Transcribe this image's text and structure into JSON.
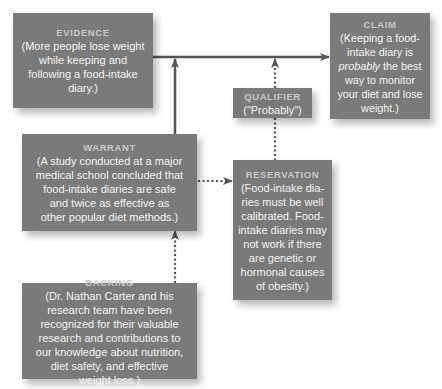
{
  "diagram": {
    "type": "Toulmin argument model",
    "nodes": {
      "evidence": {
        "title": "EVIDENCE",
        "body": "(More people lose weight\nwhile keeping and\nfollowing a food-intake\ndiary.)"
      },
      "claim": {
        "title": "CLAIM",
        "body_pre": "(Keeping a food-\nintake diary is\n",
        "body_emphasis": "probably",
        "body_post": " the best\nway to monitor\nyour diet and lose\nweight.)"
      },
      "qualifier": {
        "title": "QUALIFIER",
        "body": "(\"Probably\")"
      },
      "warrant": {
        "title": "WARRANT",
        "body": "(A study conducted at a major\nmedical school concluded that\nfood-intake diaries are safe\nand twice as effective as\nother popular diet methods.)"
      },
      "reservation": {
        "title": "RESERVATION",
        "body": "(Food-intake dia-\nries must be well\ncalibrated. Food-\nintake diaries may\nnot work if there\nare genetic or\nhormonal causes\nof obesity.)"
      },
      "backing": {
        "title": "BACKING",
        "body": "(Dr. Nathan Carter and his\nresearch team have been\nrecognized for their valuable\nresearch and contributions to\nour knowledge about nutrition,\ndiet safety, and effective\nweight loss.)"
      }
    },
    "edges": [
      {
        "from": "evidence",
        "to": "claim",
        "style": "solid",
        "arrow": "end"
      },
      {
        "from": "warrant",
        "to": "evidence-claim-line",
        "style": "solid",
        "arrow": "end"
      },
      {
        "from": "qualifier",
        "to": "evidence-claim-line",
        "style": "dotted",
        "arrow": "end"
      },
      {
        "from": "qualifier",
        "to": "reservation",
        "style": "dotted",
        "arrow": "none"
      },
      {
        "from": "warrant",
        "to": "reservation",
        "style": "dotted",
        "arrow": "end"
      },
      {
        "from": "backing",
        "to": "warrant",
        "style": "dotted",
        "arrow": "end"
      }
    ],
    "colors": {
      "box_fill": "#7a7a7a",
      "box_text": "#f3f3f3",
      "title_text": "#c9c9c9",
      "line": "#555555"
    }
  }
}
